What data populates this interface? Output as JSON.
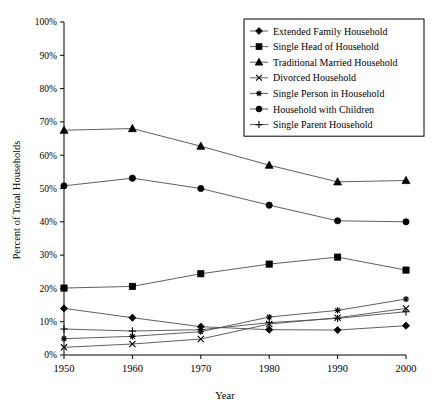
{
  "chart_data": {
    "type": "line",
    "title": "",
    "xlabel": "Year",
    "ylabel": "Percent of Total Households",
    "categories": [
      "1950",
      "1960",
      "1970",
      "1980",
      "1990",
      "2000"
    ],
    "x": [
      1950,
      1960,
      1970,
      1980,
      1990,
      2000
    ],
    "xlim": [
      1950,
      2000
    ],
    "ylim": [
      0,
      100
    ],
    "yticks": [
      "0%",
      "10%",
      "20%",
      "30%",
      "40%",
      "50%",
      "60%",
      "70%",
      "80%",
      "90%",
      "100%"
    ],
    "ytick_values": [
      0,
      10,
      20,
      30,
      40,
      50,
      60,
      70,
      80,
      90,
      100
    ],
    "grid": false,
    "legend_position": "top-right",
    "series": [
      {
        "name": "Extended Family Household",
        "marker": "diamond",
        "values": [
          14.0,
          11.2,
          8.5,
          7.6,
          7.5,
          8.8
        ]
      },
      {
        "name": "Single Head of Household",
        "marker": "square",
        "values": [
          20.1,
          20.6,
          24.4,
          27.3,
          29.4,
          25.5
        ]
      },
      {
        "name": "Traditional Married Household",
        "marker": "triangle",
        "values": [
          67.5,
          68.0,
          62.7,
          57.0,
          52.0,
          52.4
        ]
      },
      {
        "name": "Divorced Household",
        "marker": "x",
        "values": [
          2.3,
          3.3,
          4.8,
          9.3,
          11.2,
          14.0
        ]
      },
      {
        "name": "Single Person in Household",
        "marker": "star",
        "values": [
          4.9,
          5.6,
          7.0,
          11.4,
          13.4,
          16.8
        ]
      },
      {
        "name": "Household with Children",
        "marker": "circle",
        "values": [
          50.8,
          53.1,
          50.0,
          45.0,
          40.3,
          40.0
        ]
      },
      {
        "name": "Single Parent Household",
        "marker": "plus",
        "values": [
          7.8,
          7.2,
          7.6,
          9.7,
          11.0,
          13.0
        ]
      }
    ]
  }
}
